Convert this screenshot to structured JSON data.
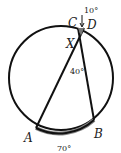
{
  "diagram": {
    "type": "circle-chords",
    "points": {
      "A": "A",
      "B": "B",
      "C": "C",
      "D": "D",
      "X": "X"
    },
    "labels": {
      "arc_CD": "10°",
      "angle_AXB": "40°",
      "arc_AB": "70°"
    },
    "colors": {
      "stroke": "#111111",
      "highlight": "#888888"
    }
  }
}
